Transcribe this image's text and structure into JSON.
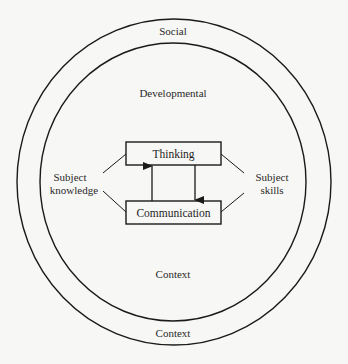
{
  "diagram": {
    "outer_ring": {
      "top_label": "Social",
      "bottom_label": "Context"
    },
    "inner_ring": {
      "top_label": "Developmental",
      "bottom_label": "Context"
    },
    "center_boxes": {
      "top": "Thinking",
      "bottom": "Communication"
    },
    "left_label": {
      "line1": "Subject",
      "line2": "knowledge"
    },
    "right_label": {
      "line1": "Subject",
      "line2": "skills"
    },
    "arrows": [
      {
        "from": "Communication",
        "to": "Thinking",
        "direction": "up"
      },
      {
        "from": "Thinking",
        "to": "Communication",
        "direction": "down"
      }
    ],
    "colors": {
      "background": "#f7f7f5",
      "stroke": "#1a1a1a",
      "text": "#2a2a2a"
    }
  }
}
